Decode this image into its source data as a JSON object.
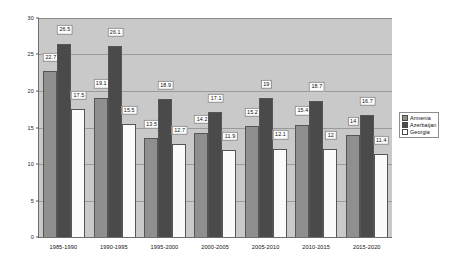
{
  "chart_data": {
    "type": "bar",
    "title": "",
    "xlabel": "",
    "ylabel": "",
    "ylim": [
      0,
      30
    ],
    "ytick_step": 5,
    "yticks": [
      "0",
      "5",
      "10",
      "15",
      "20",
      "25",
      "30"
    ],
    "grid": true,
    "legend_position": "right",
    "categories": [
      "1985-1990",
      "1990-1995",
      "1995-2000",
      "2000-2005",
      "2005-2010",
      "2010-2015",
      "2015-2020"
    ],
    "series": [
      {
        "name": "Armenia",
        "color": "#8f8f8f",
        "values": [
          22.7,
          19.1,
          13.5,
          14.2,
          15.2,
          15.4,
          14
        ],
        "labels": [
          "22.7",
          "19.1",
          "13.5",
          "14.2",
          "15.2",
          "15.4",
          "14"
        ]
      },
      {
        "name": "Azerbaijan",
        "color": "#4a4a4a",
        "values": [
          26.5,
          26.1,
          18.9,
          17.1,
          19,
          18.7,
          16.7
        ],
        "labels": [
          "26.5",
          "26.1",
          "18.9",
          "17.1",
          "19",
          "18.7",
          "16.7"
        ]
      },
      {
        "name": "Georgia",
        "color": "#ffffff",
        "values": [
          17.5,
          15.5,
          12.7,
          11.9,
          12.1,
          12,
          11.4
        ],
        "labels": [
          "17.5",
          "15.5",
          "12.7",
          "11.9",
          "12.1",
          "12",
          "11.4"
        ]
      }
    ]
  },
  "legend": {
    "items": [
      {
        "label": "Armenia"
      },
      {
        "label": "Azerbaijan"
      },
      {
        "label": "Georgia"
      }
    ]
  },
  "colors": {
    "plot_background": "#c9c9c9",
    "page_background": "#ffffff",
    "gridline": "#9a9a9a",
    "axis": "#6e6e6e",
    "series_armenia": "#8f8f8f",
    "series_azerbaijan": "#4a4a4a",
    "series_georgia": "#ffffff"
  }
}
